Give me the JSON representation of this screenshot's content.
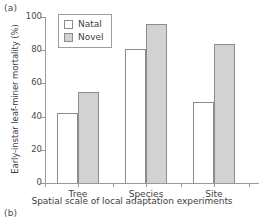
{
  "panels": {
    "a_label": "(a)",
    "b_label": "(b)"
  },
  "legend": {
    "items": [
      {
        "label": "Natal",
        "color": "#ffffff",
        "swatch": "natal-swatch-icon"
      },
      {
        "label": "Novel",
        "color": "#d2d2d2",
        "swatch": "novel-swatch-icon"
      }
    ]
  },
  "axes": {
    "y_ticks": [
      "0",
      "20",
      "40",
      "60",
      "80",
      "100"
    ],
    "x_ticks": [
      "Tree",
      "Species",
      "Site"
    ]
  },
  "chart_data": {
    "type": "bar",
    "title": "",
    "xlabel": "Spatial scale of local adaptation experiments",
    "ylabel": "Early-instar leaf-miner mortality (%)",
    "categories": [
      "Tree",
      "Species",
      "Site"
    ],
    "series": [
      {
        "name": "Natal",
        "color": "#ffffff",
        "values": [
          42,
          81,
          49
        ]
      },
      {
        "name": "Novel",
        "color": "#d2d2d2",
        "values": [
          55,
          96,
          84
        ]
      }
    ],
    "ylim": [
      0,
      100
    ],
    "yticks": [
      0,
      20,
      40,
      60,
      80,
      100
    ],
    "grid": false,
    "legend_position": "top-left"
  }
}
